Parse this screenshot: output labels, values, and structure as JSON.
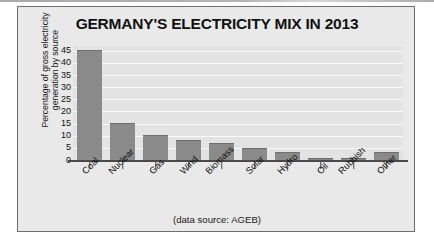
{
  "chart_data": {
    "type": "bar",
    "title": "GERMANY'S ELECTRICITY MIX IN 2013",
    "xlabel": "",
    "ylabel": "Percentage of gross electricity generation by source",
    "ylabel_line1": "Percentage of gross electricity",
    "ylabel_line2": "generation by source",
    "source_note": "(data source: AGEB)",
    "categories": [
      "Coal",
      "Nuclear",
      "Gas",
      "Wind",
      "Biomass",
      "Solar",
      "Hydro",
      "Oil",
      "Rubbish",
      "Other"
    ],
    "values": [
      45.5,
      15.4,
      10.5,
      8.4,
      7.0,
      4.8,
      3.4,
      1.0,
      0.8,
      3.3
    ],
    "ylim": [
      0,
      47
    ],
    "yticks": [
      45,
      40,
      35,
      30,
      25,
      20,
      15,
      10,
      5,
      0
    ],
    "grid": true,
    "legend": "none",
    "colors": {
      "bar_fill": "#8a8a8a",
      "plot_background": "#e3e3e3",
      "figure_background": "#e9e9e9",
      "gridline": "#fbfbfb",
      "axis": "#4a4a4a",
      "text": "#111111"
    }
  }
}
